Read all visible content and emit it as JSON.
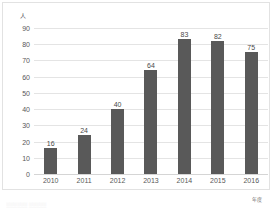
{
  "chart_data": {
    "type": "bar",
    "title": "",
    "subtitle": "",
    "xlabel": "年度",
    "ylabel": "人",
    "categories": [
      "2010",
      "2011",
      "2012",
      "2013",
      "2014",
      "2015",
      "2016"
    ],
    "values": [
      16,
      24,
      40,
      64,
      83,
      82,
      75
    ],
    "series": [
      {
        "name": "",
        "values": [
          16,
          24,
          40,
          64,
          83,
          82,
          75
        ]
      }
    ],
    "data_labels": [
      "16",
      "24",
      "40",
      "64",
      "83",
      "82",
      "75"
    ],
    "ylim": [
      0,
      90
    ],
    "ytick_step": 10,
    "ytick_labels": [
      "0",
      "10",
      "20",
      "30",
      "40",
      "50",
      "60",
      "70",
      "80",
      "90"
    ],
    "xtick_labels": [
      "2010",
      "2011",
      "2012",
      "2013",
      "2014",
      "2015",
      "2016"
    ],
    "grid": "horizontal",
    "legend": "none",
    "legend_position": "",
    "annotations": [],
    "colors": {
      "bar": "#595959",
      "gridline": "#e4e4e4",
      "baseline": "#d5d5d5",
      "axis_text": "#585858",
      "data_label": "#4a4a4a",
      "frame": "#e2e2e2",
      "background": "#ffffff"
    }
  },
  "caption_strip": "░░░░░░  ░░░░░"
}
